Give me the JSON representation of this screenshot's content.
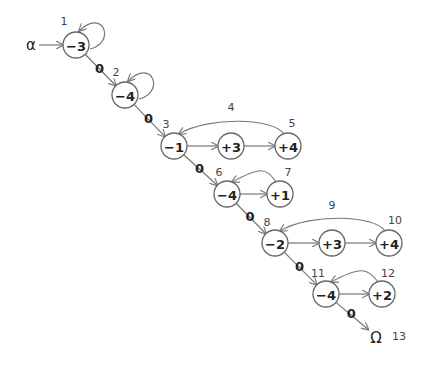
{
  "diagram": {
    "start_label": "α",
    "end_label": "Ω",
    "end_index": "13",
    "zero_label": "0",
    "nodes": [
      {
        "id": "n1",
        "value": "−3",
        "index": "1"
      },
      {
        "id": "n2",
        "value": "−4",
        "index": "2"
      },
      {
        "id": "n3",
        "value": "−1",
        "index": "3"
      },
      {
        "id": "n4",
        "value": "+3",
        "index": "4"
      },
      {
        "id": "n5",
        "value": "+4",
        "index": "5"
      },
      {
        "id": "n6",
        "value": "−4",
        "index": "6"
      },
      {
        "id": "n7",
        "value": "+1",
        "index": "7"
      },
      {
        "id": "n8",
        "value": "−2",
        "index": "8"
      },
      {
        "id": "n9",
        "value": "+3",
        "index": "9"
      },
      {
        "id": "n10",
        "value": "+4",
        "index": "10"
      },
      {
        "id": "n11",
        "value": "−4",
        "index": "11"
      },
      {
        "id": "n12",
        "value": "+2",
        "index": "12"
      }
    ],
    "edges": [
      {
        "from": "alpha",
        "to": "n1",
        "label": ""
      },
      {
        "from": "n1",
        "to": "n1",
        "label": "",
        "type": "self-loop"
      },
      {
        "from": "n1",
        "to": "n2",
        "label": "0"
      },
      {
        "from": "n2",
        "to": "n2",
        "label": "",
        "type": "self-loop"
      },
      {
        "from": "n2",
        "to": "n3",
        "label": "0"
      },
      {
        "from": "n3",
        "to": "n4",
        "label": ""
      },
      {
        "from": "n4",
        "to": "n5",
        "label": ""
      },
      {
        "from": "n5",
        "to": "n3",
        "label": "",
        "type": "back"
      },
      {
        "from": "n3",
        "to": "n6",
        "label": "0"
      },
      {
        "from": "n6",
        "to": "n7",
        "label": ""
      },
      {
        "from": "n7",
        "to": "n6",
        "label": "",
        "type": "back"
      },
      {
        "from": "n6",
        "to": "n8",
        "label": "0"
      },
      {
        "from": "n8",
        "to": "n9",
        "label": ""
      },
      {
        "from": "n9",
        "to": "n10",
        "label": ""
      },
      {
        "from": "n10",
        "to": "n8",
        "label": "",
        "type": "back"
      },
      {
        "from": "n8",
        "to": "n11",
        "label": "0"
      },
      {
        "from": "n11",
        "to": "n12",
        "label": ""
      },
      {
        "from": "n12",
        "to": "n11",
        "label": "",
        "type": "back"
      },
      {
        "from": "n11",
        "to": "omega",
        "label": "0"
      }
    ]
  }
}
